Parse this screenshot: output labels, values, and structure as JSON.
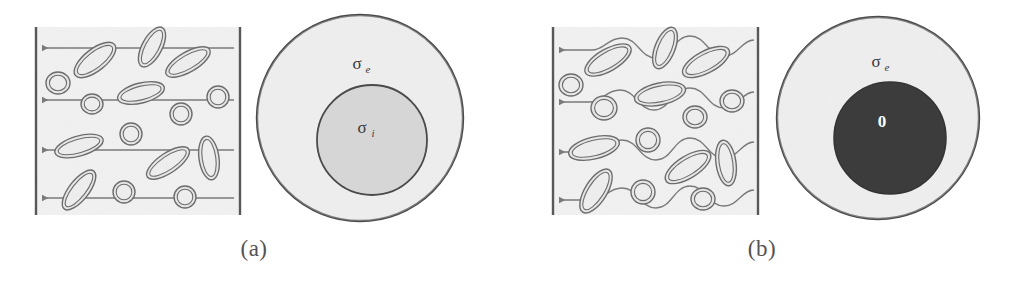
{
  "figure": {
    "background": "#ffffff",
    "style": {
      "matrix_fill": "#ebebeb",
      "inclusion_stroke": "#6d6d6d",
      "inclusion_fill": "#e4e4e4",
      "flow_line_color": "#7a7a7a",
      "border_color": "#585858",
      "outer_circle_fill": "#e8e8e8",
      "inner_circle_fill_a": "#d6d6d6",
      "inner_circle_fill_b": "#3c3c3c",
      "circle_stroke": "#4a4a4a",
      "label_color": "#3b3b3b",
      "caption_color": "#555252"
    }
  },
  "panels": [
    {
      "id": "a",
      "caption": "(a)",
      "square": {
        "name": "composite-rve-square",
        "x": 36,
        "y": 27,
        "width": 204,
        "height": 188,
        "flow_type": "straight",
        "flow_lines": [
          {
            "y": 48
          },
          {
            "y": 100
          },
          {
            "y": 150
          },
          {
            "y": 198
          }
        ],
        "arrow_direction": "left",
        "inclusions": [
          {
            "cx": 95,
            "cy": 60,
            "rx": 25,
            "ry": 11,
            "rot": -38
          },
          {
            "cx": 58,
            "cy": 83,
            "rx": 12,
            "ry": 11,
            "rot": 0
          },
          {
            "cx": 152,
            "cy": 47,
            "rx": 22,
            "ry": 10,
            "rot": -62
          },
          {
            "cx": 188,
            "cy": 62,
            "rx": 25,
            "ry": 10,
            "rot": -30
          },
          {
            "cx": 92,
            "cy": 104,
            "rx": 11,
            "ry": 10,
            "rot": 0
          },
          {
            "cx": 141,
            "cy": 93,
            "rx": 24,
            "ry": 10,
            "rot": -14
          },
          {
            "cx": 218,
            "cy": 97,
            "rx": 11,
            "ry": 11,
            "rot": 0
          },
          {
            "cx": 181,
            "cy": 114,
            "rx": 11,
            "ry": 11,
            "rot": 0
          },
          {
            "cx": 79,
            "cy": 146,
            "rx": 25,
            "ry": 10,
            "rot": -16
          },
          {
            "cx": 131,
            "cy": 134,
            "rx": 11,
            "ry": 11,
            "rot": 0
          },
          {
            "cx": 168,
            "cy": 163,
            "rx": 25,
            "ry": 10,
            "rot": -34
          },
          {
            "cx": 209,
            "cy": 158,
            "rx": 10,
            "ry": 22,
            "rot": -8
          },
          {
            "cx": 79,
            "cy": 190,
            "rx": 24,
            "ry": 10,
            "rot": -52
          },
          {
            "cx": 124,
            "cy": 192,
            "rx": 11,
            "ry": 11,
            "rot": 0
          },
          {
            "cx": 185,
            "cy": 197,
            "rx": 11,
            "ry": 11,
            "rot": 0
          }
        ]
      },
      "equivalent": {
        "name": "equivalent-inclusion-circle",
        "outer": {
          "cx": 360,
          "cy": 118,
          "r": 103,
          "fill_key": "outer_circle_fill"
        },
        "inner": {
          "cx": 372,
          "cy": 140,
          "r": 55,
          "fill_key": "inner_circle_fill_a"
        },
        "outer_label": {
          "symbol": "σ",
          "subscript": "e",
          "x": 357,
          "y": 69
        },
        "inner_label": {
          "symbol": "σ",
          "subscript": "i",
          "x": 362,
          "y": 133
        }
      }
    },
    {
      "id": "b",
      "caption": "(b)",
      "square": {
        "name": "composite-rve-square",
        "x": 45,
        "y": 27,
        "width": 205,
        "height": 188,
        "flow_type": "wavy",
        "flow_lines": [
          {
            "y": 48
          },
          {
            "y": 100
          },
          {
            "y": 150
          },
          {
            "y": 198
          }
        ],
        "arrow_direction": "left",
        "inclusions": [
          {
            "cx": 100,
            "cy": 60,
            "rx": 26,
            "ry": 11,
            "rot": -30
          },
          {
            "cx": 63,
            "cy": 85,
            "rx": 12,
            "ry": 11,
            "rot": 0
          },
          {
            "cx": 157,
            "cy": 48,
            "rx": 22,
            "ry": 10,
            "rot": -68
          },
          {
            "cx": 198,
            "cy": 62,
            "rx": 26,
            "ry": 11,
            "rot": -28
          },
          {
            "cx": 96,
            "cy": 108,
            "rx": 13,
            "ry": 12,
            "rot": 0
          },
          {
            "cx": 152,
            "cy": 94,
            "rx": 26,
            "ry": 11,
            "rot": -12
          },
          {
            "cx": 224,
            "cy": 101,
            "rx": 12,
            "ry": 11,
            "rot": 0
          },
          {
            "cx": 187,
            "cy": 117,
            "rx": 12,
            "ry": 11,
            "rot": 0
          },
          {
            "cx": 86,
            "cy": 148,
            "rx": 26,
            "ry": 11,
            "rot": -14
          },
          {
            "cx": 140,
            "cy": 140,
            "rx": 12,
            "ry": 12,
            "rot": 0
          },
          {
            "cx": 180,
            "cy": 167,
            "rx": 26,
            "ry": 11,
            "rot": -32
          },
          {
            "cx": 218,
            "cy": 163,
            "rx": 10,
            "ry": 23,
            "rot": -8
          },
          {
            "cx": 88,
            "cy": 191,
            "rx": 25,
            "ry": 11,
            "rot": -58
          },
          {
            "cx": 135,
            "cy": 192,
            "rx": 12,
            "ry": 12,
            "rot": 0
          },
          {
            "cx": 195,
            "cy": 199,
            "rx": 12,
            "ry": 11,
            "rot": 0
          }
        ]
      },
      "equivalent": {
        "name": "equivalent-inclusion-circle",
        "outer": {
          "cx": 370,
          "cy": 118,
          "r": 101,
          "fill_key": "outer_circle_fill"
        },
        "inner": {
          "cx": 382,
          "cy": 138,
          "r": 56,
          "fill_key": "inner_circle_fill_b"
        },
        "outer_label": {
          "symbol": "σ",
          "subscript": "e",
          "x": 368,
          "y": 67
        },
        "inner_label": {
          "symbol": "0",
          "subscript": "",
          "x": 374,
          "y": 127
        }
      }
    }
  ]
}
